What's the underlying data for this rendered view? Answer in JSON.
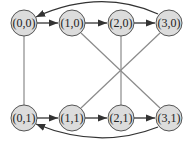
{
  "diagram": {
    "colors": {
      "node_fill": "#dcdcdc",
      "node_stroke": "#555555",
      "edge_undirected": "#8a8a8a",
      "edge_directed": "#333333",
      "background": "#ffffff"
    },
    "nodes": [
      {
        "id": "n00",
        "label": "(0,0)",
        "x": 24,
        "y": 23
      },
      {
        "id": "n10",
        "label": "(1,0)",
        "x": 72,
        "y": 23
      },
      {
        "id": "n20",
        "label": "(2,0)",
        "x": 121,
        "y": 23
      },
      {
        "id": "n30",
        "label": "(3,0)",
        "x": 169,
        "y": 23
      },
      {
        "id": "n01",
        "label": "(0,1)",
        "x": 24,
        "y": 118
      },
      {
        "id": "n11",
        "label": "(1,1)",
        "x": 72,
        "y": 118
      },
      {
        "id": "n21",
        "label": "(2,1)",
        "x": 121,
        "y": 118
      },
      {
        "id": "n31",
        "label": "(3,1)",
        "x": 169,
        "y": 118
      }
    ],
    "directed_edges": [
      {
        "from": "(0,0)",
        "to": "(1,0)"
      },
      {
        "from": "(1,0)",
        "to": "(2,0)"
      },
      {
        "from": "(2,0)",
        "to": "(3,0)"
      },
      {
        "from": "(3,0)",
        "to": "(0,0)",
        "curved": "top"
      },
      {
        "from": "(0,1)",
        "to": "(1,1)"
      },
      {
        "from": "(1,1)",
        "to": "(2,1)"
      },
      {
        "from": "(2,1)",
        "to": "(3,1)"
      },
      {
        "from": "(3,1)",
        "to": "(0,1)",
        "curved": "bottom"
      }
    ],
    "undirected_edges": [
      {
        "a": "(0,0)",
        "b": "(0,1)"
      },
      {
        "a": "(1,0)",
        "b": "(3,1)"
      },
      {
        "a": "(2,0)",
        "b": "(2,1)"
      },
      {
        "a": "(3,0)",
        "b": "(1,1)"
      }
    ]
  }
}
